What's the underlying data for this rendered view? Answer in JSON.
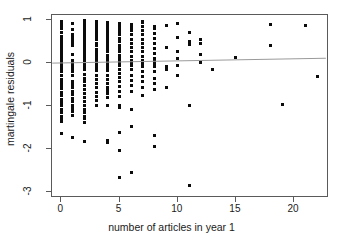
{
  "chart_data": {
    "type": "scatter",
    "title": "",
    "xlabel": "number of articles in year 1",
    "ylabel": "martingale residuals",
    "xlim": [
      -0.8,
      23.0
    ],
    "ylim": [
      -3.15,
      1.12
    ],
    "xticks": [
      0,
      5,
      10,
      15,
      20
    ],
    "xtick_labels": [
      "0",
      "5",
      "10",
      "15",
      "20"
    ],
    "yticks": [
      1,
      0,
      -1,
      -2,
      -3
    ],
    "ytick_labels": [
      "1",
      "0",
      "-1",
      "-2",
      "-3"
    ],
    "grid": false,
    "legend": null,
    "frame": "box",
    "point_color": "#0b0b0b",
    "point_marker": "filled-square",
    "series": [
      {
        "name": "martingale residuals",
        "points": [
          [
            0,
            0.98
          ],
          [
            0,
            0.95
          ],
          [
            0,
            0.9
          ],
          [
            0,
            0.88
          ],
          [
            0,
            0.84
          ],
          [
            0,
            0.8
          ],
          [
            0,
            0.72
          ],
          [
            0,
            0.62
          ],
          [
            0,
            0.58
          ],
          [
            0,
            0.5
          ],
          [
            0,
            0.44
          ],
          [
            0,
            0.38
          ],
          [
            0,
            0.33
          ],
          [
            0,
            0.28
          ],
          [
            0,
            0.24
          ],
          [
            0,
            0.2
          ],
          [
            0,
            0.16
          ],
          [
            0,
            0.12
          ],
          [
            0,
            0.08
          ],
          [
            0,
            0.05
          ],
          [
            0,
            0.02
          ],
          [
            0,
            -0.01
          ],
          [
            0,
            -0.04
          ],
          [
            0,
            -0.07
          ],
          [
            0,
            -0.1
          ],
          [
            0,
            -0.14
          ],
          [
            0,
            -0.2
          ],
          [
            0,
            -0.3
          ],
          [
            0,
            -0.38
          ],
          [
            0,
            -0.45
          ],
          [
            0,
            -0.52
          ],
          [
            0,
            -0.6
          ],
          [
            0,
            -0.68
          ],
          [
            0,
            -0.76
          ],
          [
            0,
            -0.84
          ],
          [
            0,
            -0.92
          ],
          [
            0,
            -1.0
          ],
          [
            0,
            -1.08
          ],
          [
            0,
            -1.16
          ],
          [
            0,
            -1.24
          ],
          [
            0,
            -1.3
          ],
          [
            0,
            -1.36
          ],
          [
            0,
            -1.64
          ],
          [
            1,
            0.92
          ],
          [
            1,
            0.78
          ],
          [
            1,
            0.66
          ],
          [
            1,
            0.6
          ],
          [
            1,
            0.54
          ],
          [
            1,
            0.48
          ],
          [
            1,
            0.42
          ],
          [
            1,
            0.2
          ],
          [
            1,
            0.06
          ],
          [
            1,
            0.02
          ],
          [
            1,
            -0.02
          ],
          [
            1,
            -0.06
          ],
          [
            1,
            -0.12
          ],
          [
            1,
            -0.2
          ],
          [
            1,
            -0.3
          ],
          [
            1,
            -0.42
          ],
          [
            1,
            -0.5
          ],
          [
            1,
            -0.58
          ],
          [
            1,
            -0.66
          ],
          [
            1,
            -0.74
          ],
          [
            1,
            -0.82
          ],
          [
            1,
            -0.9
          ],
          [
            1,
            -0.98
          ],
          [
            1,
            -1.06
          ],
          [
            1,
            -1.14
          ],
          [
            1,
            -1.22
          ],
          [
            1,
            -1.74
          ],
          [
            2,
            1.0
          ],
          [
            2,
            0.94
          ],
          [
            2,
            0.88
          ],
          [
            2,
            0.82
          ],
          [
            2,
            0.76
          ],
          [
            2,
            0.7
          ],
          [
            2,
            0.64
          ],
          [
            2,
            0.58
          ],
          [
            2,
            0.5
          ],
          [
            2,
            0.44
          ],
          [
            2,
            0.36
          ],
          [
            2,
            0.3
          ],
          [
            2,
            0.22
          ],
          [
            2,
            0.16
          ],
          [
            2,
            0.1
          ],
          [
            2,
            0.05
          ],
          [
            2,
            0.0
          ],
          [
            2,
            -0.05
          ],
          [
            2,
            -0.1
          ],
          [
            2,
            -0.16
          ],
          [
            2,
            -0.26
          ],
          [
            2,
            -0.36
          ],
          [
            2,
            -0.44
          ],
          [
            2,
            -0.52
          ],
          [
            2,
            -0.62
          ],
          [
            2,
            -0.72
          ],
          [
            2,
            -0.8
          ],
          [
            2,
            -0.9
          ],
          [
            2,
            -1.0
          ],
          [
            2,
            -1.08
          ],
          [
            2,
            -1.16
          ],
          [
            2,
            -1.24
          ],
          [
            2,
            -1.3
          ],
          [
            2,
            -1.38
          ],
          [
            2,
            -1.84
          ],
          [
            3,
            0.96
          ],
          [
            3,
            0.9
          ],
          [
            3,
            0.84
          ],
          [
            3,
            0.78
          ],
          [
            3,
            0.72
          ],
          [
            3,
            0.66
          ],
          [
            3,
            0.6
          ],
          [
            3,
            0.54
          ],
          [
            3,
            0.46
          ],
          [
            3,
            0.4
          ],
          [
            3,
            0.32
          ],
          [
            3,
            0.26
          ],
          [
            3,
            0.2
          ],
          [
            3,
            0.14
          ],
          [
            3,
            0.08
          ],
          [
            3,
            0.04
          ],
          [
            3,
            0.0
          ],
          [
            3,
            -0.04
          ],
          [
            3,
            -0.1
          ],
          [
            3,
            -0.18
          ],
          [
            3,
            -0.28
          ],
          [
            3,
            -0.38
          ],
          [
            3,
            -0.48
          ],
          [
            3,
            -0.58
          ],
          [
            3,
            -0.68
          ],
          [
            3,
            -0.78
          ],
          [
            3,
            -0.88
          ],
          [
            3,
            -0.98
          ],
          [
            4,
            0.94
          ],
          [
            4,
            0.88
          ],
          [
            4,
            0.82
          ],
          [
            4,
            0.76
          ],
          [
            4,
            0.68
          ],
          [
            4,
            0.62
          ],
          [
            4,
            0.54
          ],
          [
            4,
            0.48
          ],
          [
            4,
            0.4
          ],
          [
            4,
            0.34
          ],
          [
            4,
            0.26
          ],
          [
            4,
            0.18
          ],
          [
            4,
            0.1
          ],
          [
            4,
            0.04
          ],
          [
            4,
            0.0
          ],
          [
            4,
            -0.04
          ],
          [
            4,
            -0.1
          ],
          [
            4,
            -0.18
          ],
          [
            4,
            -0.28
          ],
          [
            4,
            -0.38
          ],
          [
            4,
            -0.48
          ],
          [
            4,
            -0.56
          ],
          [
            4,
            -0.64
          ],
          [
            4,
            -0.72
          ],
          [
            4,
            -0.8
          ],
          [
            4,
            -1.0
          ],
          [
            4,
            -1.8
          ],
          [
            4,
            -1.86
          ],
          [
            5,
            0.92
          ],
          [
            5,
            0.86
          ],
          [
            5,
            0.8
          ],
          [
            5,
            0.74
          ],
          [
            5,
            0.66
          ],
          [
            5,
            0.58
          ],
          [
            5,
            0.5
          ],
          [
            5,
            0.42
          ],
          [
            5,
            0.34
          ],
          [
            5,
            0.26
          ],
          [
            5,
            0.18
          ],
          [
            5,
            0.1
          ],
          [
            5,
            0.04
          ],
          [
            5,
            0.0
          ],
          [
            5,
            -0.06
          ],
          [
            5,
            -0.14
          ],
          [
            5,
            -0.24
          ],
          [
            5,
            -0.34
          ],
          [
            5,
            -0.44
          ],
          [
            5,
            -0.54
          ],
          [
            5,
            -0.66
          ],
          [
            5,
            -0.78
          ],
          [
            5,
            -1.0
          ],
          [
            5,
            -1.04
          ],
          [
            5,
            -1.62
          ],
          [
            5,
            -2.04
          ],
          [
            5,
            -2.68
          ],
          [
            6,
            0.9
          ],
          [
            6,
            0.84
          ],
          [
            6,
            0.76
          ],
          [
            6,
            0.66
          ],
          [
            6,
            0.56
          ],
          [
            6,
            0.46
          ],
          [
            6,
            0.36
          ],
          [
            6,
            0.26
          ],
          [
            6,
            0.16
          ],
          [
            6,
            0.06
          ],
          [
            6,
            0.0
          ],
          [
            6,
            -0.06
          ],
          [
            6,
            -0.16
          ],
          [
            6,
            -0.28
          ],
          [
            6,
            -0.4
          ],
          [
            6,
            -0.52
          ],
          [
            6,
            -0.66
          ],
          [
            6,
            -1.08
          ],
          [
            6,
            -1.48
          ],
          [
            6,
            -2.56
          ],
          [
            7,
            0.98
          ],
          [
            7,
            0.94
          ],
          [
            7,
            0.86
          ],
          [
            7,
            0.76
          ],
          [
            7,
            0.66
          ],
          [
            7,
            0.56
          ],
          [
            7,
            0.46
          ],
          [
            7,
            0.36
          ],
          [
            7,
            0.26
          ],
          [
            7,
            0.16
          ],
          [
            7,
            0.06
          ],
          [
            7,
            0.0
          ],
          [
            7,
            -0.08
          ],
          [
            7,
            -0.2
          ],
          [
            7,
            -0.32
          ],
          [
            7,
            -0.44
          ],
          [
            7,
            -0.56
          ],
          [
            7,
            -0.76
          ],
          [
            8,
            0.86
          ],
          [
            8,
            0.8
          ],
          [
            8,
            0.7
          ],
          [
            8,
            0.58
          ],
          [
            8,
            0.46
          ],
          [
            8,
            0.34
          ],
          [
            8,
            0.22
          ],
          [
            8,
            0.1
          ],
          [
            8,
            0.04
          ],
          [
            8,
            0.0
          ],
          [
            8,
            -0.08
          ],
          [
            8,
            -0.2
          ],
          [
            8,
            -0.36
          ],
          [
            8,
            -0.48
          ],
          [
            8,
            -0.62
          ],
          [
            8,
            -1.7
          ],
          [
            8,
            -1.94
          ],
          [
            9,
            0.88
          ],
          [
            9,
            0.36
          ],
          [
            9,
            -0.08
          ],
          [
            9,
            -0.16
          ],
          [
            9,
            -0.56
          ],
          [
            10,
            0.92
          ],
          [
            10,
            0.6
          ],
          [
            10,
            0.26
          ],
          [
            10,
            0.1
          ],
          [
            10,
            -0.06
          ],
          [
            10,
            -0.3
          ],
          [
            11,
            0.72
          ],
          [
            11,
            0.5
          ],
          [
            11,
            0.44
          ],
          [
            11,
            -1.0
          ],
          [
            11,
            -2.85
          ],
          [
            12,
            0.54
          ],
          [
            12,
            0.46
          ],
          [
            12,
            0.2
          ],
          [
            12,
            0.02
          ],
          [
            13,
            -0.14
          ],
          [
            15,
            0.14
          ],
          [
            18,
            0.9
          ],
          [
            18,
            0.4
          ],
          [
            19,
            -0.97
          ],
          [
            21,
            0.87
          ],
          [
            22,
            -0.31
          ]
        ]
      }
    ],
    "trend_line": {
      "name": "smoother",
      "color": "#9a9a9a",
      "width": 1,
      "x_start": -0.78,
      "y_start": -0.015,
      "x_end": 22.9,
      "y_end": 0.1
    }
  }
}
